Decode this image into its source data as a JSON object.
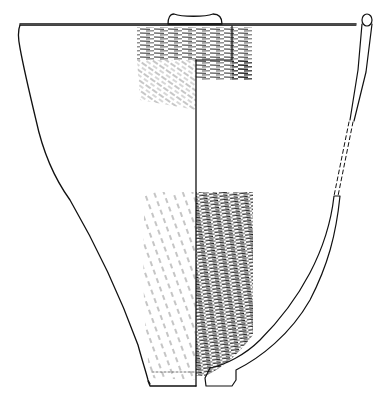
{
  "figure": {
    "type": "archaeological pottery vessel drawing",
    "view": "half exterior / half section",
    "colors": {
      "ink": "#111111",
      "background": "#ffffff"
    },
    "elements": {
      "rim_line": {
        "x1": 20,
        "y1": 24,
        "x2": 356,
        "y2": 24
      },
      "lug": {
        "cx": 194,
        "top": 13,
        "bottom": 24,
        "left": 167,
        "right": 222
      },
      "axis_line": {
        "x": 196,
        "y1": 60,
        "y2": 386
      },
      "base": {
        "y": 386,
        "left": 148,
        "right": 250
      },
      "section_rim_knob": {
        "cx": 367,
        "cy": 20
      }
    }
  }
}
